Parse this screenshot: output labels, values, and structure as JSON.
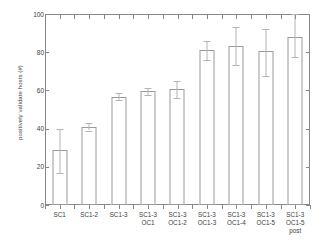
{
  "chart_data": {
    "type": "bar",
    "title": "",
    "xlabel": "",
    "ylabel": "positively validate hosts (#)",
    "ylim": [
      0,
      100
    ],
    "yticks": [
      0,
      20,
      40,
      60,
      80,
      100
    ],
    "ytick_labels": [
      "0",
      "20",
      "40",
      "60",
      "80",
      "100"
    ],
    "grid": false,
    "legend": "none",
    "error_bars": true,
    "categories": [
      "SC1",
      "SC1-2",
      "SC1-3",
      "SC1-3 OC1",
      "SC1-3 OC1-2",
      "SC1-3 OC1-3",
      "SC1-3 OC1-4",
      "SC1-3 OC1-5",
      "SC1-3 OC1-5 post"
    ],
    "category_lines": [
      [
        "SC1"
      ],
      [
        "SC1-2"
      ],
      [
        "SC1-3"
      ],
      [
        "SC1-3",
        "OC1"
      ],
      [
        "SC1-3",
        "OC1-2"
      ],
      [
        "SC1-3",
        "OC1-3"
      ],
      [
        "SC1-3",
        "OC1-4"
      ],
      [
        "SC1-3",
        "OC1-5"
      ],
      [
        "SC1-3",
        "OC1-5",
        "post"
      ]
    ],
    "values": [
      29,
      41,
      56.5,
      59.5,
      60.5,
      81,
      83.5,
      80.5,
      88
    ],
    "err_low": [
      17,
      39,
      55,
      57.5,
      56,
      76,
      73.5,
      67.5,
      77.5
    ],
    "err_high": [
      40,
      43,
      58.5,
      61,
      65,
      86,
      93,
      92,
      100
    ],
    "bar_face_color": "#ffffff",
    "bar_edge_color": "#9a9a9a",
    "error_bar_color": "#b4b4b4",
    "axis_color": "#888888",
    "text_color": "#3d3d3d",
    "background_color": "#ffffff"
  }
}
